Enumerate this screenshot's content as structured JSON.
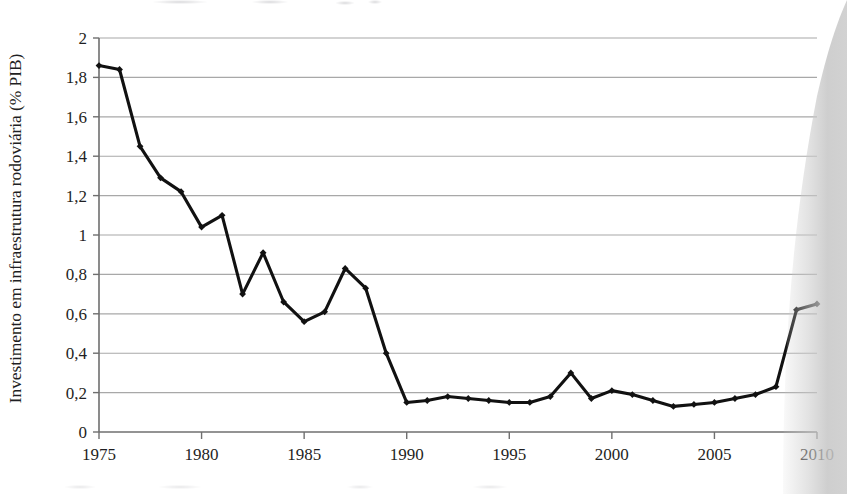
{
  "chart_data": {
    "type": "line",
    "title": "",
    "xlabel": "",
    "ylabel": "Investimento em infraestrutura rodoviária (% PIB)",
    "xlim": [
      1975,
      2010
    ],
    "ylim": [
      0,
      2
    ],
    "grid": true,
    "legend": "none",
    "marker": "diamond",
    "line_color": "#111111",
    "grid_color": "#9a9a9a",
    "axis_color": "#6f6f6f",
    "decimal_separator": ",",
    "x": [
      1975,
      1976,
      1977,
      1978,
      1979,
      1980,
      1981,
      1982,
      1983,
      1984,
      1985,
      1986,
      1987,
      1988,
      1989,
      1990,
      1991,
      1992,
      1993,
      1994,
      1995,
      1996,
      1997,
      1998,
      1999,
      2000,
      2001,
      2002,
      2003,
      2004,
      2005,
      2006,
      2007,
      2008,
      2009,
      2010
    ],
    "values": [
      1.86,
      1.84,
      1.45,
      1.29,
      1.22,
      1.04,
      1.1,
      0.7,
      0.91,
      0.66,
      0.56,
      0.61,
      0.83,
      0.73,
      0.4,
      0.15,
      0.16,
      0.18,
      0.17,
      0.16,
      0.15,
      0.15,
      0.18,
      0.3,
      0.17,
      0.21,
      0.19,
      0.16,
      0.13,
      0.14,
      0.15,
      0.17,
      0.19,
      0.23,
      0.62,
      0.65
    ],
    "ytick_values": [
      0,
      0.2,
      0.4,
      0.6,
      0.8,
      1.0,
      1.2,
      1.4,
      1.6,
      1.8,
      2.0
    ],
    "ytick_labels": [
      "0",
      "0,2",
      "0,4",
      "0,6",
      "0,8",
      "1",
      "1,2",
      "1,4",
      "1,6",
      "1,8",
      "2"
    ],
    "xtick_values": [
      1975,
      1980,
      1985,
      1990,
      1995,
      2000,
      2005,
      2010
    ],
    "xtick_labels": [
      "1975",
      "1980",
      "1985",
      "1990",
      "1995",
      "2000",
      "2005",
      "2010"
    ]
  }
}
